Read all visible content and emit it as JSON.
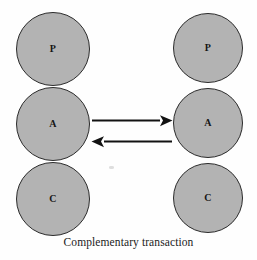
{
  "figure": {
    "caption": "Complementary transaction",
    "type": "transactional-analysis-ego-state-diagram",
    "background_color": "#fefefe"
  },
  "style": {
    "circle_fill": "#b3b3b3",
    "circle_stroke": "#2b2b2b",
    "arrow_color": "#121212",
    "text_color": "#161616"
  },
  "columns": [
    {
      "id": "left",
      "name": "agent-left",
      "circles": [
        {
          "label": "P",
          "name": "parent",
          "full_name": "Parent"
        },
        {
          "label": "A",
          "name": "adult",
          "full_name": "Adult"
        },
        {
          "label": "C",
          "name": "child",
          "full_name": "Child"
        }
      ]
    },
    {
      "id": "right",
      "name": "agent-right",
      "circles": [
        {
          "label": "P",
          "name": "parent",
          "full_name": "Parent"
        },
        {
          "label": "A",
          "name": "adult",
          "full_name": "Adult"
        },
        {
          "label": "C",
          "name": "child",
          "full_name": "Child"
        }
      ]
    }
  ],
  "arrows": [
    {
      "name": "stimulus-arrow",
      "direction": "left-to-right",
      "from": "left.A",
      "to": "right.A",
      "label": ""
    },
    {
      "name": "response-arrow",
      "direction": "right-to-left",
      "from": "right.A",
      "to": "left.A",
      "label": ""
    }
  ]
}
